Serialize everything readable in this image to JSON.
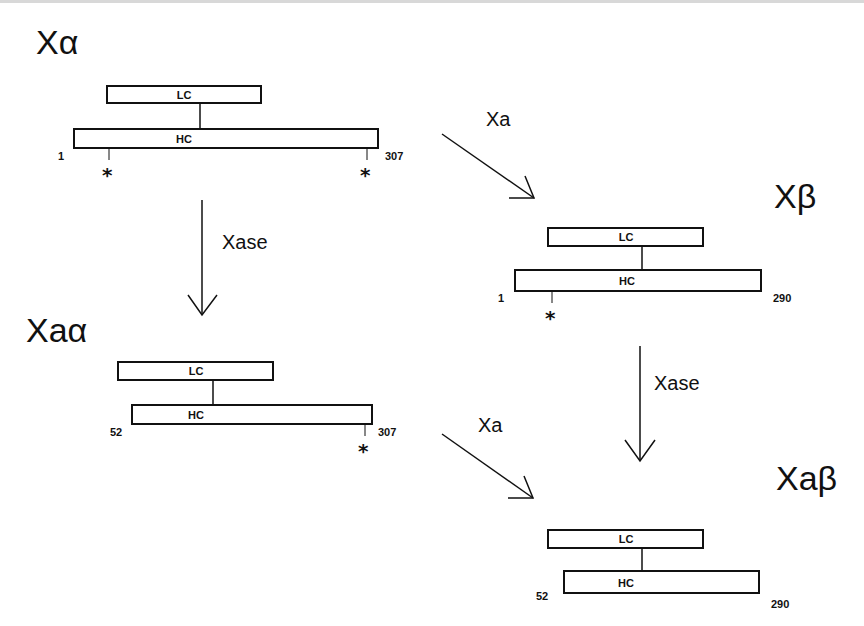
{
  "diagram": {
    "species": {
      "x_alpha": {
        "title": "Xα",
        "lc": "LC",
        "hc": "HC",
        "start": "1",
        "end": "307",
        "sites": [
          "*",
          "*"
        ]
      },
      "x_beta": {
        "title": "Xβ",
        "lc": "LC",
        "hc": "HC",
        "start": "1",
        "end": "290",
        "sites": [
          "*"
        ]
      },
      "xa_alpha": {
        "title": "Xaα",
        "lc": "LC",
        "hc": "HC",
        "start": "52",
        "end": "307",
        "sites": [
          "*"
        ]
      },
      "xa_beta": {
        "title": "Xaβ",
        "lc": "LC",
        "hc": "HC",
        "start": "52",
        "end": "290",
        "sites": []
      }
    },
    "arrows": {
      "xa_top": "Xa",
      "xase_left": "Xase",
      "xase_right": "Xase",
      "xa_bottom": "Xa"
    }
  }
}
